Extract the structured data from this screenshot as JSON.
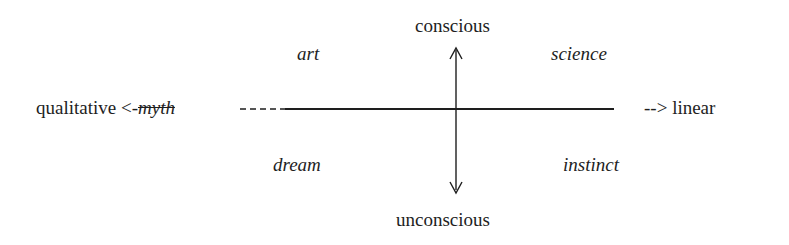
{
  "diagram": {
    "axes": {
      "vertical": {
        "top_label": "conscious",
        "bottom_label": "unconscious"
      },
      "horizontal": {
        "left_label": "qualitative",
        "left_prefix": "<-",
        "left_term": "myth",
        "left_dashes": "---",
        "right_dashes": "-->",
        "right_label": "linear"
      }
    },
    "quadrants": {
      "top_left": "art",
      "top_right": "science",
      "bottom_left": "dream",
      "bottom_right": "instinct"
    },
    "colors": {
      "ink": "#1e1e1e",
      "background": "#ffffff"
    }
  }
}
